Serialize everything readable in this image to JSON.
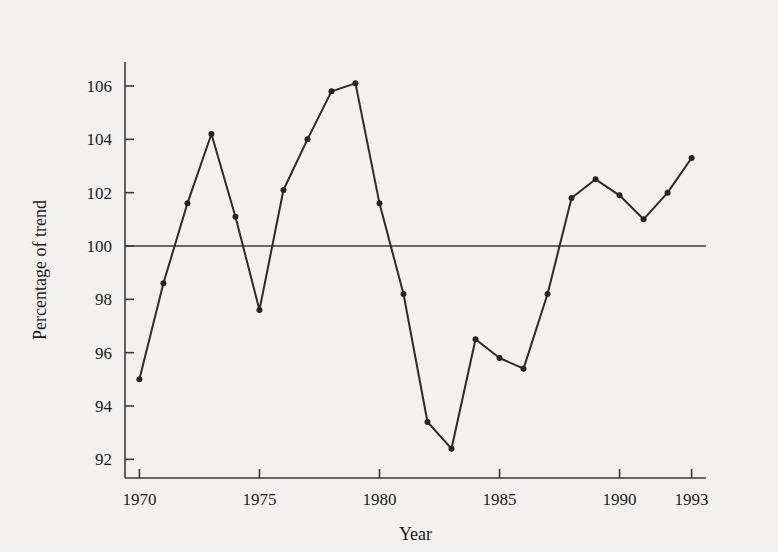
{
  "chart_data": {
    "type": "line",
    "title": "",
    "xlabel": "Year",
    "ylabel": "Percentage of trend",
    "x": [
      1970,
      1971,
      1972,
      1973,
      1974,
      1975,
      1976,
      1977,
      1978,
      1979,
      1980,
      1981,
      1982,
      1983,
      1984,
      1985,
      1986,
      1987,
      1988,
      1989,
      1990,
      1991,
      1992,
      1993
    ],
    "values": [
      95.0,
      98.6,
      101.6,
      104.2,
      101.1,
      97.6,
      102.1,
      104.0,
      105.8,
      106.1,
      101.6,
      98.2,
      93.4,
      92.4,
      96.5,
      95.8,
      95.4,
      98.2,
      101.8,
      102.5,
      101.9,
      101.0,
      102.0,
      103.3
    ],
    "series": [
      {
        "name": "Percentage of trend",
        "values": [
          95.0,
          98.6,
          101.6,
          104.2,
          101.1,
          97.6,
          102.1,
          104.0,
          105.8,
          106.1,
          101.6,
          98.2,
          93.4,
          92.4,
          96.5,
          95.8,
          95.4,
          98.2,
          101.8,
          102.5,
          101.9,
          101.0,
          102.0,
          103.3
        ]
      }
    ],
    "xlim": [
      1969.4,
      1993.6
    ],
    "ylim": [
      91.3,
      106.9
    ],
    "xticks": [
      1970,
      1975,
      1980,
      1985,
      1990,
      1993
    ],
    "xticklabels": [
      "1970",
      "1975",
      "1980",
      "1985",
      "1990",
      "1993"
    ],
    "yticks": [
      92,
      94,
      96,
      98,
      100,
      102,
      104,
      106
    ],
    "yticklabels": [
      "92",
      "94",
      "96",
      "98",
      "100",
      "102",
      "104",
      "106"
    ],
    "grid": false,
    "legend": false,
    "legend_position": "none",
    "reference_lines": [
      {
        "axis": "y",
        "value": 100,
        "label": ""
      }
    ],
    "marker": "circle",
    "line_color": "#2b2b2b",
    "marker_color": "#232323",
    "background_color": "#f2f1ef"
  },
  "style": {
    "axis_color": "#3a3a3a",
    "text_color": "#1a1a1a"
  }
}
